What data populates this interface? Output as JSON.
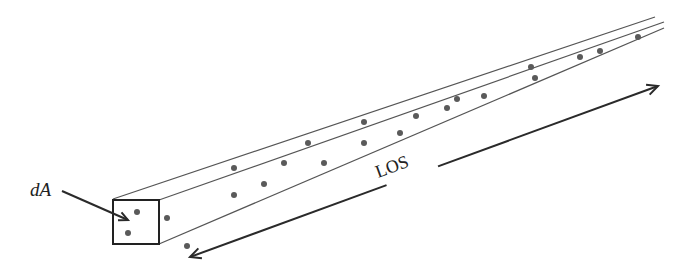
{
  "diagram": {
    "type": "line-of-sight column",
    "labels": {
      "area": "dA",
      "los": "LOS"
    },
    "colors": {
      "line": "#555555",
      "box": "#222222",
      "dot": "#5a5a5a",
      "arrow": "#2a2a2a"
    },
    "column_edges": [
      {
        "x1": 113,
        "y1": 199,
        "x2": 655,
        "y2": 17
      },
      {
        "x1": 159,
        "y1": 200,
        "x2": 664,
        "y2": 22
      },
      {
        "x1": 159,
        "y1": 244,
        "x2": 664,
        "y2": 28
      }
    ],
    "front_face": {
      "x": 113,
      "y": 200,
      "w": 46,
      "h": 44
    },
    "particles": [
      [
        137,
        212
      ],
      [
        128,
        233
      ],
      [
        167,
        218
      ],
      [
        187,
        246
      ],
      [
        234,
        168
      ],
      [
        234,
        195
      ],
      [
        264,
        184
      ],
      [
        284,
        163
      ],
      [
        308,
        143
      ],
      [
        324,
        163
      ],
      [
        364,
        122
      ],
      [
        364,
        143
      ],
      [
        400,
        133
      ],
      [
        416,
        116
      ],
      [
        447,
        108
      ],
      [
        457,
        99
      ],
      [
        484,
        96
      ],
      [
        531,
        67
      ],
      [
        535,
        78
      ],
      [
        580,
        57
      ],
      [
        600,
        51
      ],
      [
        638,
        37
      ]
    ],
    "los_arrow": {
      "start": {
        "x": 190,
        "y": 257
      },
      "end": {
        "x": 658,
        "y": 86
      },
      "gap_from": 0.42,
      "gap_to": 0.53
    },
    "da_arrow": {
      "x1": 62,
      "y1": 191,
      "x2": 128,
      "y2": 220
    }
  }
}
